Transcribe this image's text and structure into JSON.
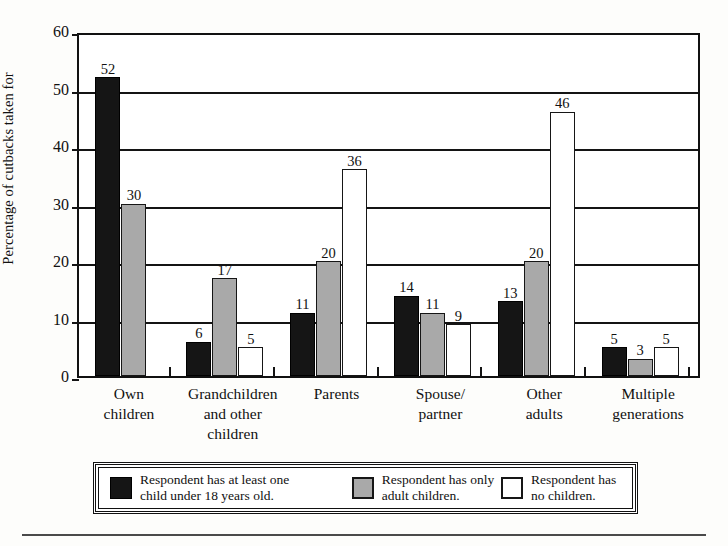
{
  "chart_data": {
    "type": "bar",
    "title": "",
    "xlabel": "",
    "ylabel": "Percentage of cutbacks taken for",
    "ylim": [
      0,
      60
    ],
    "yticks": [
      0,
      10,
      20,
      30,
      40,
      50,
      60
    ],
    "grid": true,
    "legend_position": "bottom",
    "categories": [
      "Own children",
      "Grandchildren and other children",
      "Parents",
      "Spouse/ partner",
      "Other adults",
      "Multiple generations"
    ],
    "category_lines": [
      [
        "Own",
        "children"
      ],
      [
        "Grandchildren",
        "and other",
        "children"
      ],
      [
        "Parents"
      ],
      [
        "Spouse/",
        "partner"
      ],
      [
        "Other",
        "adults"
      ],
      [
        "Multiple",
        "generations"
      ]
    ],
    "series": [
      {
        "name": "Respondent has at least one child under 18 years old.",
        "color": "#151515",
        "values": [
          52,
          6,
          11,
          14,
          13,
          5
        ]
      },
      {
        "name": "Respondent has only adult children.",
        "color": "#a9a9a9",
        "values": [
          30,
          17,
          20,
          11,
          20,
          3
        ]
      },
      {
        "name": "Respondent has no children.",
        "color": "#ffffff",
        "values": [
          null,
          5,
          36,
          9,
          46,
          5
        ]
      }
    ]
  },
  "legend": [
    {
      "swatch": "dark",
      "line1": "Respondent has at least one",
      "line2": "child under 18 years old."
    },
    {
      "swatch": "gray",
      "line1": "Respondent has only",
      "line2": "adult children."
    },
    {
      "swatch": "white",
      "line1": "Respondent has",
      "line2": "no children."
    }
  ]
}
